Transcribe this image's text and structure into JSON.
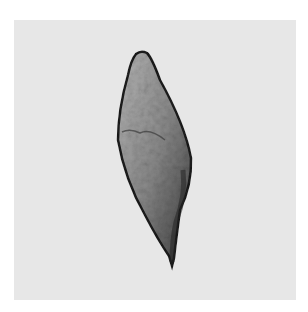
{
  "image": {
    "subject": "micrograph of elongated spindle-shaped parasite egg with terminal spine",
    "style": "grayscale brightfield microscopy",
    "colors": {
      "page_background": "#ffffff",
      "panel_background": "#e7e7e7",
      "egg_outline": "#1c1c1c",
      "egg_fill": "#8a8a8a",
      "egg_fill_light": "#b8b8b8",
      "egg_fill_dark": "#3a3a3a"
    }
  }
}
